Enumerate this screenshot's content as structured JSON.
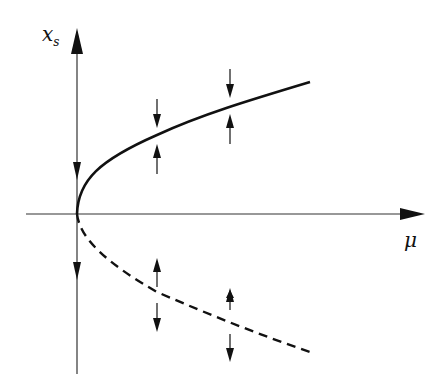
{
  "axes": {
    "y_label": "x",
    "y_label_sub": "s",
    "x_label": "μ"
  },
  "branches": [
    {
      "name": "stable",
      "style": "solid"
    },
    {
      "name": "unstable",
      "style": "dashed"
    }
  ],
  "colors": {
    "ink": "#111111",
    "background": "#ffffff"
  }
}
